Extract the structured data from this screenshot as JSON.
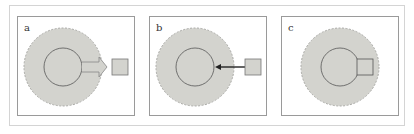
{
  "figure": {
    "panels": [
      {
        "label": "a",
        "relation": "block-arrow-outward",
        "description": "thick arrow from inner circle to external square"
      },
      {
        "label": "b",
        "relation": "thin-arrow-inward",
        "description": "thin arrow from external square into inner circle"
      },
      {
        "label": "c",
        "relation": "attached",
        "description": "square attached to inner circle edge"
      }
    ],
    "colors": {
      "halo_fill": "#d3d3ce",
      "halo_stroke": "#a8a8a4",
      "inner_stroke": "#555555",
      "square_fill": "#d3d3ce",
      "square_stroke": "#777777",
      "arrow_stroke": "#222222",
      "frame": "#9a9a9a"
    }
  }
}
